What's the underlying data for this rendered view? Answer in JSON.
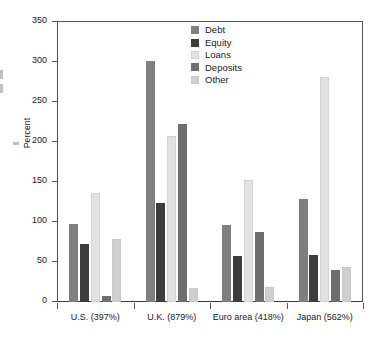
{
  "chart_data": {
    "type": "bar",
    "title": "",
    "xlabel": "",
    "ylabel": "Percent",
    "ylim": [
      0,
      350
    ],
    "yticks": [
      0,
      50,
      100,
      150,
      200,
      250,
      300,
      350
    ],
    "grid": false,
    "legend_position": "top-center",
    "categories": [
      "U.S. (397%)",
      "U.K. (879%)",
      "Euro area (418%)",
      "Japan (562%)"
    ],
    "series": [
      {
        "name": "Debt",
        "color": "#7f7f7f",
        "values": [
          97,
          301,
          96,
          129
        ]
      },
      {
        "name": "Equity",
        "color": "#3d3d3d",
        "values": [
          73,
          124,
          57,
          59
        ]
      },
      {
        "name": "Loans",
        "color": "#e2e2e2",
        "values": [
          136,
          208,
          152,
          281
        ]
      },
      {
        "name": "Deposits",
        "color": "#6e6e6e",
        "values": [
          8,
          223,
          87,
          40
        ]
      },
      {
        "name": "Other",
        "color": "#cfcfcf",
        "values": [
          79,
          17,
          19,
          44
        ]
      }
    ]
  },
  "axis": {
    "y_label": "Percent",
    "y_tick_labels": [
      "0",
      "50",
      "100",
      "150",
      "200",
      "250",
      "300",
      "350"
    ],
    "x_tick_labels": [
      "U.S. (397%)",
      "U.K. (879%)",
      "Euro area (418%)",
      "Japan (562%)"
    ]
  },
  "legend": {
    "items": [
      {
        "label": "Debt",
        "color": "#7f7f7f"
      },
      {
        "label": "Equity",
        "color": "#3d3d3d"
      },
      {
        "label": "Loans",
        "color": "#e2e2e2"
      },
      {
        "label": "Deposits",
        "color": "#6e6e6e"
      },
      {
        "label": "Other",
        "color": "#cfcfcf"
      }
    ]
  }
}
